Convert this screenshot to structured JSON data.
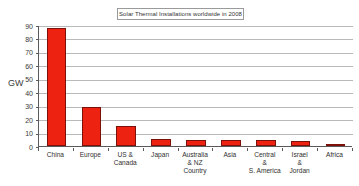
{
  "chart_data": {
    "type": "bar",
    "title": "Solar Thermal Installations worldwide in 2008",
    "xlabel": "Country",
    "ylabel": "GW",
    "ylim": [
      0,
      90
    ],
    "ytick_step": 10,
    "grid": true,
    "legend": "none",
    "bar_color": "#ee2211",
    "bar_edge_color": "#7d1008",
    "gridline_color": "#b9b9b9",
    "axis_color": "#5a5a5a",
    "background_color": "#ffffff",
    "categories": [
      "China",
      "Europe",
      "US & Canada",
      "Japan",
      "Australia & NZ",
      "Asia",
      "Central & S. America",
      "Israel & Jordan",
      "Africa"
    ],
    "category_lines": [
      [
        "China"
      ],
      [
        "Europe"
      ],
      [
        "US &",
        "Canada"
      ],
      [
        "Japan"
      ],
      [
        "Australia",
        "& NZ"
      ],
      [
        "Asia"
      ],
      [
        "Central",
        "&",
        "S. America"
      ],
      [
        "Israel",
        "&",
        "Jordan"
      ],
      [
        "Africa"
      ]
    ],
    "values": [
      88,
      29,
      15,
      5,
      4.8,
      4.6,
      4.2,
      4,
      1
    ],
    "yticks": [
      0,
      10,
      20,
      30,
      40,
      50,
      60,
      70,
      80,
      90
    ],
    "ytick_labels": [
      "0",
      "10",
      "20",
      "30",
      "40",
      "50",
      "60",
      "70",
      "80",
      "90"
    ]
  }
}
